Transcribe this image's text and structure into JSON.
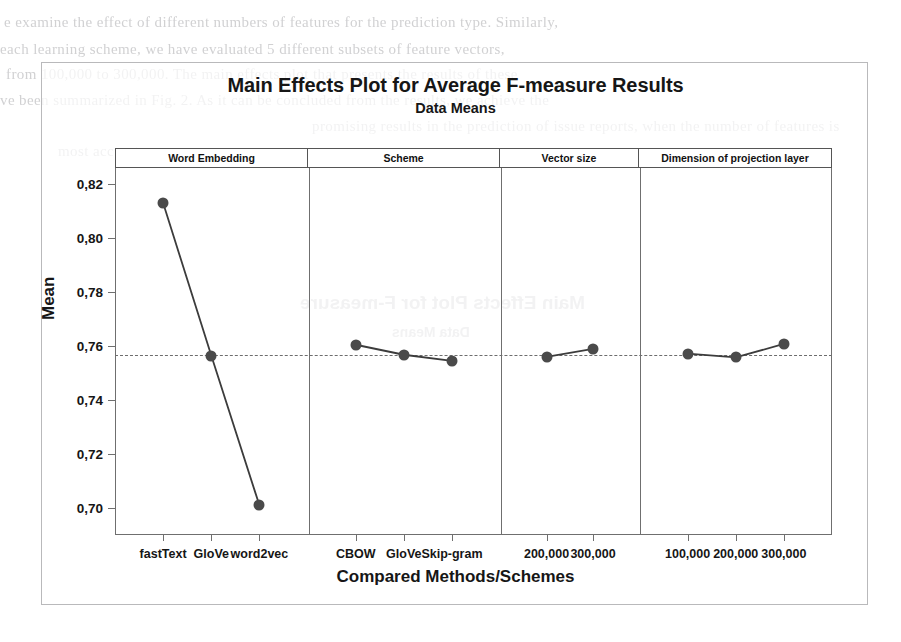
{
  "figure": {
    "title": "Main Effects Plot for Average F-measure Results",
    "subtitle": "Data Means",
    "y_axis_title": "Mean",
    "x_axis_title": "Compared Methods/Schemes"
  },
  "ghost_text": {
    "note": "faint bleed-through text from the scanned page",
    "lines": [
      "e examine the effect of different numbers of features for the prediction type. Similarly,",
      "each learning scheme, we have evaluated 5 different subsets of feature vectors,",
      "from 100,000 to 300,000. The main effects plot that presents the results of these",
      "ve been summarized in Fig. 2. As it can be concluded from the results, we achieve the",
      "promising results in the prediction of issue reports, when the number of features is",
      "most accurate"
    ],
    "mirrored": [
      "Main Effects Plot for F-measure",
      "Data Means"
    ]
  },
  "chart_data": {
    "type": "line",
    "title": "Main Effects Plot for Average F-measure Results",
    "subtitle": "Data Means",
    "xlabel": "Compared Methods/Schemes",
    "ylabel": "Mean",
    "ylim": [
      0.69,
      0.826
    ],
    "yticks": [
      0.82,
      0.8,
      0.78,
      0.76,
      0.74,
      0.72,
      0.7
    ],
    "ytick_labels": [
      "0,82",
      "0,80",
      "0,78",
      "0,76",
      "0,74",
      "0,72",
      "0,70"
    ],
    "grid": false,
    "reference_line": {
      "value": 0.7567,
      "style": "dashed",
      "label": "grand mean"
    },
    "marker": "filled-circle",
    "marker_color": "#4a4a4a",
    "line_color": "#3c3c3c",
    "panels": [
      {
        "name": "Word Embedding",
        "categories": [
          "fastText",
          "GloVe",
          "word2vec"
        ],
        "values": [
          0.813,
          0.7565,
          0.701
        ]
      },
      {
        "name": "Scheme",
        "categories": [
          "CBOW",
          "GloVe",
          "Skip-gram"
        ],
        "values": [
          0.7605,
          0.7568,
          0.7545
        ]
      },
      {
        "name": "Vector size",
        "categories": [
          "200,000",
          "300,000"
        ],
        "values": [
          0.756,
          0.759
        ]
      },
      {
        "name": "Dimension of projection layer",
        "categories": [
          "100,000",
          "200,000",
          "300,000"
        ],
        "values": [
          0.7572,
          0.7558,
          0.7608
        ]
      }
    ]
  }
}
